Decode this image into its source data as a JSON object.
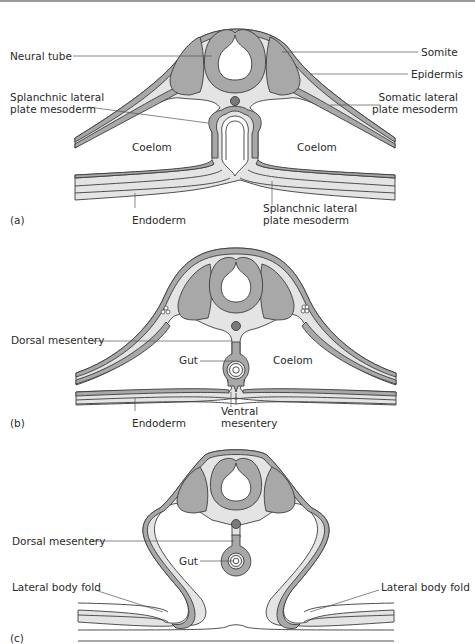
{
  "figure": {
    "panels": [
      {
        "id": "a",
        "tag": "(a)",
        "labels": {
          "neural_tube": "Neural tube",
          "somite": "Somite",
          "epidermis": "Epidermis",
          "splanchnic_left_1": "Splanchnic lateral",
          "splanchnic_left_2": "plate mesoderm",
          "somatic_1": "Somatic lateral",
          "somatic_2": "plate mesoderm",
          "coelom_left": "Coelom",
          "coelom_right": "Coelom",
          "endoderm": "Endoderm",
          "splanchnic_bottom_1": "Splanchnic lateral",
          "splanchnic_bottom_2": "plate mesoderm"
        }
      },
      {
        "id": "b",
        "tag": "(b)",
        "labels": {
          "dorsal_mesentery": "Dorsal mesentery",
          "gut": "Gut",
          "coelom": "Coelom",
          "endoderm": "Endoderm",
          "ventral_1": "Ventral",
          "ventral_2": "mesentery"
        }
      },
      {
        "id": "c",
        "tag": "(c)",
        "labels": {
          "dorsal_mesentery": "Dorsal mesentery",
          "gut": "Gut",
          "lateral_fold_left": "Lateral body fold",
          "lateral_fold_right": "Lateral body fold"
        }
      }
    ],
    "colors": {
      "dark_tissue": "#a8a8a8",
      "light_tissue": "#e4e4e4",
      "outline": "#3c3c3c",
      "notochord": "#7a7a7a",
      "leader": "#555555"
    }
  }
}
